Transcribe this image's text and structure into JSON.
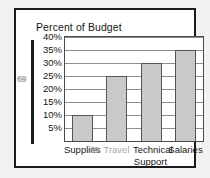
{
  "figure": {
    "title": "Percent of Budget",
    "artifacts": {
      "y_axis_noise": "69",
      "x_axis_noise": "69"
    }
  },
  "chart_data": {
    "type": "bar",
    "title": "Percent of Budget",
    "xlabel": "",
    "ylabel": "",
    "categories": [
      "Supplies",
      "Travel",
      "Technical Support",
      "Salaries"
    ],
    "category_lines": [
      [
        "Supplies"
      ],
      [
        "Travel"
      ],
      [
        "Technical",
        "Support"
      ],
      [
        "Salaries"
      ]
    ],
    "values": [
      10,
      25,
      30,
      35
    ],
    "value_labels": [
      "10%",
      "25%",
      "30%",
      "35%"
    ],
    "ylim": [
      0,
      40
    ],
    "yticks": [
      40,
      35,
      30,
      25,
      20,
      15,
      10,
      5
    ],
    "ytick_labels": [
      "40%",
      "35%",
      "30%",
      "25%",
      "20%",
      "15%",
      "10%",
      "5%"
    ],
    "grid": true,
    "grid_axis": "y",
    "legend": false,
    "legend_position": "none",
    "bar_fill_color": "#c9c9c9",
    "bar_edge_color": "#555555",
    "grid_color": "#8e8e8e",
    "text_color": "#161616",
    "frame_color": "#1b1b1b",
    "background_color": "#ffffff"
  }
}
